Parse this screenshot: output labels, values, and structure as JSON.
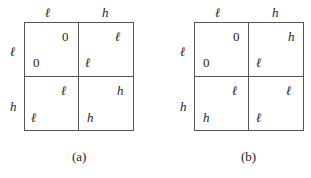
{
  "panels": [
    {
      "caption": "(a)",
      "col_headers": [
        "ℓ",
        "h"
      ],
      "row_headers": [
        "ℓ",
        "h"
      ],
      "cells": [
        [
          {
            "top": "0",
            "bottom": "0"
          },
          {
            "top": "ℓ",
            "bottom": "ℓ"
          }
        ],
        [
          {
            "top": "ℓ",
            "bottom": "ℓ"
          },
          {
            "top": "h",
            "bottom": "h"
          }
        ]
      ]
    },
    {
      "caption": "(b)",
      "col_headers": [
        "ℓ",
        "h"
      ],
      "row_headers": [
        "ℓ",
        "h"
      ],
      "cells": [
        [
          {
            "top": "0",
            "bottom": "0"
          },
          {
            "top": "h",
            "bottom": "ℓ"
          }
        ],
        [
          {
            "top": "ℓ",
            "bottom": "h"
          },
          {
            "top": "ℓ",
            "bottom": "ℓ"
          }
        ]
      ]
    }
  ]
}
